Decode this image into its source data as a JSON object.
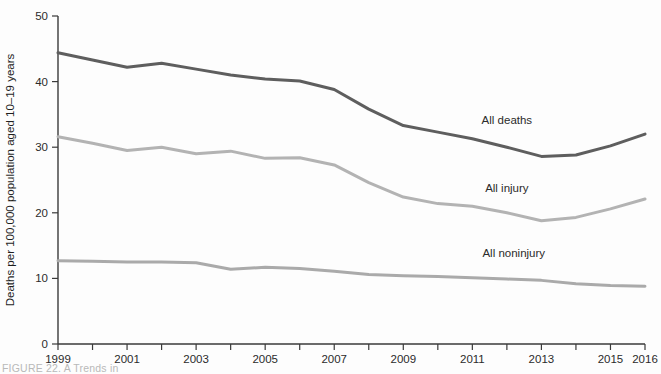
{
  "figure": {
    "caption": "FIGURE 22.  A Trends in",
    "background": "#fdfdfd"
  },
  "axes": {
    "y_title": "Deaths per 100,000 population aged 10–19 years",
    "y_ticks": [
      "0",
      "10",
      "20",
      "30",
      "40",
      "50"
    ],
    "x_ticks_labeled": [
      "1999",
      "2001",
      "2003",
      "2005",
      "2007",
      "2009",
      "2011",
      "2013",
      "2015",
      "2016"
    ]
  },
  "series_labels": {
    "all_deaths": "All deaths",
    "all_injury": "All injury",
    "all_noninjury": "All noninjury"
  },
  "colors": {
    "all_deaths": "#5e5e5e",
    "all_injury": "#b3b3b3",
    "all_noninjury": "#aaaaaa",
    "axis": "#3a3a3a",
    "text": "#2b2b2b"
  },
  "chart_data": {
    "type": "line",
    "title": "",
    "subtitle": "",
    "xlabel": "",
    "ylabel": "Deaths per 100,000 population aged 10–19 years",
    "xlim": [
      1999,
      2016
    ],
    "ylim": [
      0,
      50
    ],
    "ytick_values": [
      0,
      10,
      20,
      30,
      40,
      50
    ],
    "xtick_values": [
      1999,
      2000,
      2001,
      2002,
      2003,
      2004,
      2005,
      2006,
      2007,
      2008,
      2009,
      2010,
      2011,
      2012,
      2013,
      2014,
      2015,
      2016
    ],
    "xtick_labels_shown": [
      1999,
      2001,
      2003,
      2005,
      2007,
      2009,
      2011,
      2013,
      2015,
      2016
    ],
    "grid": false,
    "legend_position": "inline-right-annotations",
    "x": [
      1999,
      2000,
      2001,
      2002,
      2003,
      2004,
      2005,
      2006,
      2007,
      2008,
      2009,
      2010,
      2011,
      2012,
      2013,
      2014,
      2015,
      2016
    ],
    "series": [
      {
        "name": "All deaths",
        "color": "#5e5e5e",
        "values": [
          44.4,
          43.3,
          42.2,
          42.8,
          41.9,
          41.0,
          40.4,
          40.1,
          38.8,
          35.8,
          33.3,
          32.3,
          31.3,
          30.0,
          28.6,
          28.8,
          30.2,
          32.0
        ]
      },
      {
        "name": "All injury",
        "color": "#b3b3b3",
        "values": [
          31.6,
          30.6,
          29.5,
          30.0,
          29.0,
          29.4,
          28.3,
          28.4,
          27.3,
          24.6,
          22.4,
          21.4,
          21.0,
          20.0,
          18.8,
          19.3,
          20.6,
          22.1
        ]
      },
      {
        "name": "All noninjury",
        "color": "#aaaaaa",
        "values": [
          12.7,
          12.6,
          12.5,
          12.5,
          12.4,
          11.4,
          11.7,
          11.5,
          11.1,
          10.6,
          10.4,
          10.3,
          10.1,
          9.9,
          9.7,
          9.2,
          8.9,
          8.8
        ]
      }
    ],
    "annotations": [
      {
        "text": "All deaths",
        "x": 2012.0,
        "y": 33.6
      },
      {
        "text": "All injury",
        "x": 2012.0,
        "y": 23.2
      },
      {
        "text": "All noninjury",
        "x": 2012.2,
        "y": 13.2
      }
    ]
  }
}
